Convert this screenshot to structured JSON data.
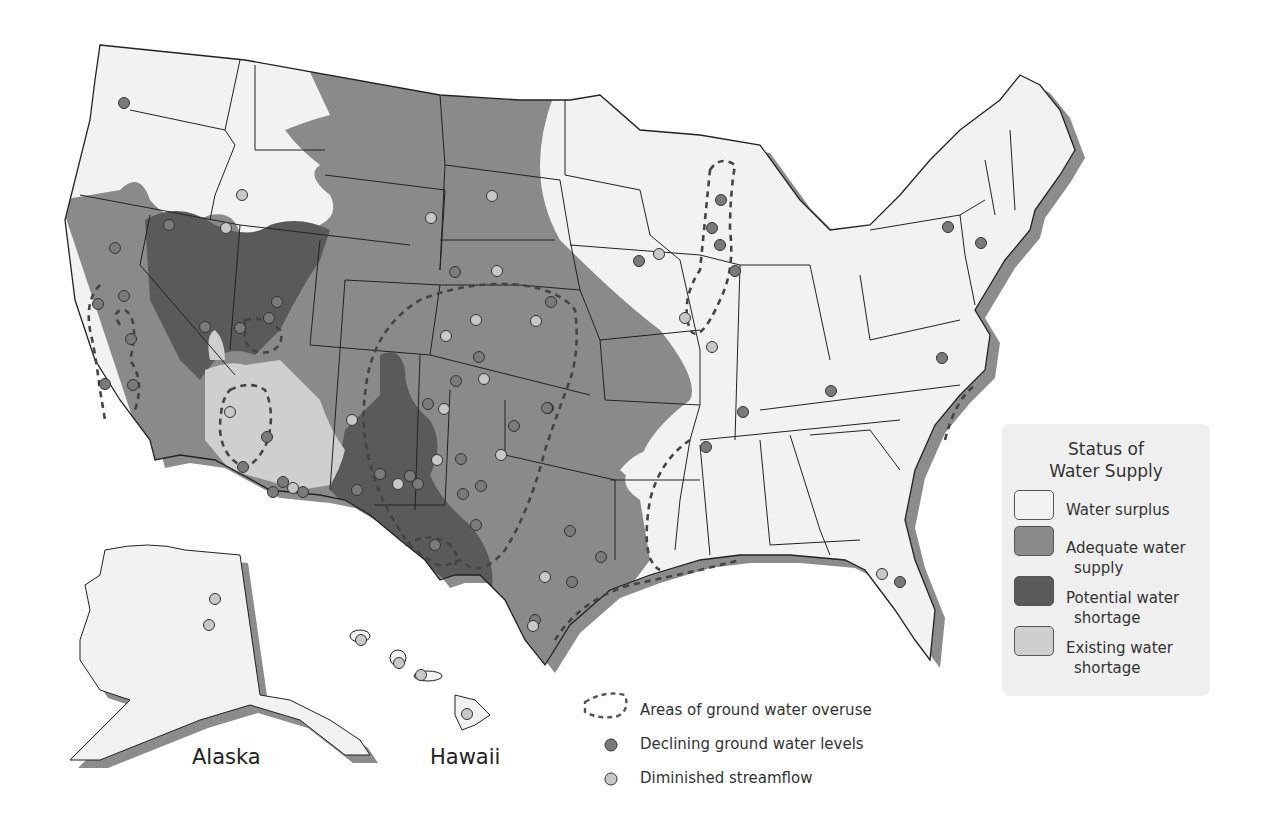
{
  "colors": {
    "surplus": "#f2f2f2",
    "adequate": "#8a8a8a",
    "potential": "#5a5a5a",
    "existing": "#cfcfcf",
    "shadow": "#8c8c8c",
    "declining_dot": "#7a7a7a",
    "streamflow_dot": "#c8c8c8",
    "background": "#ffffff"
  },
  "legend": {
    "title_line1": "Status of",
    "title_line2": "Water Supply",
    "items": [
      {
        "key": "surplus",
        "label_line1": "Water surplus",
        "label_line2": ""
      },
      {
        "key": "adequate",
        "label_line1": "Adequate water",
        "label_line2": "supply"
      },
      {
        "key": "potential",
        "label_line1": "Potential water",
        "label_line2": "shortage"
      },
      {
        "key": "existing",
        "label_line1": "Existing water",
        "label_line2": "shortage"
      }
    ]
  },
  "symbol_legend": {
    "overuse": "Areas of ground water overuse",
    "declining": "Declining ground water levels",
    "streamflow": "Diminished streamflow"
  },
  "place_labels": {
    "alaska": "Alaska",
    "hawaii": "Hawaii"
  },
  "points": {
    "declining": [
      [
        124,
        103
      ],
      [
        169,
        225
      ],
      [
        115,
        248
      ],
      [
        124,
        296
      ],
      [
        98,
        304
      ],
      [
        131,
        339
      ],
      [
        133,
        385
      ],
      [
        105,
        384
      ],
      [
        205,
        327
      ],
      [
        277,
        302
      ],
      [
        267,
        437
      ],
      [
        269,
        318
      ],
      [
        240,
        328
      ],
      [
        455,
        272
      ],
      [
        551,
        302
      ],
      [
        479,
        357
      ],
      [
        456,
        381
      ],
      [
        428,
        404
      ],
      [
        461,
        459
      ],
      [
        481,
        486
      ],
      [
        476,
        525
      ],
      [
        463,
        494
      ],
      [
        570,
        531
      ],
      [
        514,
        426
      ],
      [
        548,
        408
      ],
      [
        380,
        474
      ],
      [
        357,
        490
      ],
      [
        418,
        484
      ],
      [
        410,
        476
      ],
      [
        572,
        582
      ],
      [
        601,
        557
      ],
      [
        535,
        620
      ],
      [
        435,
        545
      ],
      [
        547,
        408
      ],
      [
        639,
        261
      ],
      [
        712,
        228
      ],
      [
        720,
        245
      ],
      [
        735,
        271
      ],
      [
        721,
        200
      ],
      [
        948,
        227
      ],
      [
        981,
        243
      ],
      [
        942,
        358
      ],
      [
        831,
        391
      ],
      [
        743,
        412
      ],
      [
        706,
        447
      ],
      [
        900,
        582
      ],
      [
        283,
        482
      ],
      [
        303,
        492
      ],
      [
        243,
        467
      ],
      [
        273,
        492
      ]
    ],
    "streamflow": [
      [
        242,
        195
      ],
      [
        226,
        228
      ],
      [
        431,
        218
      ],
      [
        492,
        196
      ],
      [
        659,
        254
      ],
      [
        685,
        318
      ],
      [
        712,
        347
      ],
      [
        497,
        271
      ],
      [
        476,
        320
      ],
      [
        536,
        321
      ],
      [
        446,
        336
      ],
      [
        484,
        379
      ],
      [
        444,
        409
      ],
      [
        352,
        420
      ],
      [
        398,
        484
      ],
      [
        501,
        455
      ],
      [
        437,
        460
      ],
      [
        545,
        577
      ],
      [
        533,
        626
      ],
      [
        882,
        574
      ],
      [
        230,
        412
      ],
      [
        293,
        488
      ],
      [
        215,
        599
      ],
      [
        209,
        625
      ],
      [
        361,
        640
      ],
      [
        399,
        663
      ],
      [
        421,
        675
      ],
      [
        467,
        714
      ]
    ]
  }
}
